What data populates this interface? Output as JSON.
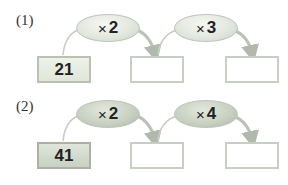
{
  "problems": [
    {
      "label": "(1)",
      "start": "21",
      "operations": [
        {
          "symbol": "×",
          "operand": "2"
        },
        {
          "symbol": "×",
          "operand": "3"
        }
      ],
      "results": [
        "",
        ""
      ]
    },
    {
      "label": "(2)",
      "start": "41",
      "operations": [
        {
          "symbol": "×",
          "operand": "2"
        },
        {
          "symbol": "×",
          "operand": "4"
        }
      ],
      "results": [
        "",
        ""
      ]
    }
  ],
  "colors": {
    "arrow": "#b9c2b4",
    "box_border": "#c9cec4",
    "start_box_fill_1": "#e6ebe1",
    "start_box_fill_2": "#d3dacd"
  }
}
